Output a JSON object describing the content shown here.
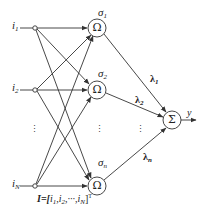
{
  "diagram": {
    "type": "RBF neural network",
    "colors": {
      "stroke": "#333333",
      "text": "#222222",
      "background": "#ffffff"
    },
    "inputs": [
      {
        "name": "i",
        "sub": "1"
      },
      {
        "name": "i",
        "sub": "2"
      },
      {
        "name": "i",
        "sub": "N"
      }
    ],
    "input_vector": {
      "prefix": "I=[",
      "items": [
        "i",
        "1",
        ",",
        "i",
        "2",
        ",···,",
        "i",
        "N"
      ],
      "suffix": "]",
      "sup": "T"
    },
    "hidden_nodes": [
      {
        "symbol": "Ω",
        "sigma": "σ",
        "sub": "1"
      },
      {
        "symbol": "Ω",
        "sigma": "σ",
        "sub": "2"
      },
      {
        "symbol": "Ω",
        "sigma": "σ",
        "sub": "n"
      }
    ],
    "weights": [
      {
        "name": "λ",
        "sub": "1"
      },
      {
        "name": "λ",
        "sub": "2"
      },
      {
        "name": "λ",
        "sub": "n"
      }
    ],
    "output_node": {
      "symbol": "Σ"
    },
    "output": {
      "label": "y"
    },
    "ellipsis": "⋮"
  }
}
